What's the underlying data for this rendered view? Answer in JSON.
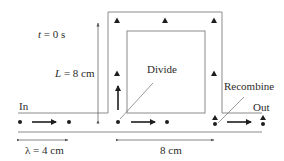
{
  "diagram": {
    "type": "interferometer-wave-split",
    "labels": {
      "time": "t = 0 s",
      "time_var": "t",
      "time_rest": " = 0 s",
      "length": "L = 8 cm",
      "length_var": "L",
      "length_rest": " = 8 cm",
      "divide": "Divide",
      "recombine": "Recombine",
      "in": "In",
      "out": "Out",
      "wavelength": "λ = 4 cm",
      "lower_distance": "8 cm"
    },
    "colors": {
      "line": "#8a8a8a",
      "marker": "#1e1e1e",
      "text": "#2a2a2a"
    },
    "markers": {
      "dots": [
        20,
        69,
        118,
        167,
        215,
        263
      ],
      "triangles_top": [
        117,
        165,
        214
      ],
      "triangles_side": [
        {
          "x": 117,
          "y": 73
        },
        {
          "x": 214,
          "y": 73
        }
      ]
    }
  }
}
